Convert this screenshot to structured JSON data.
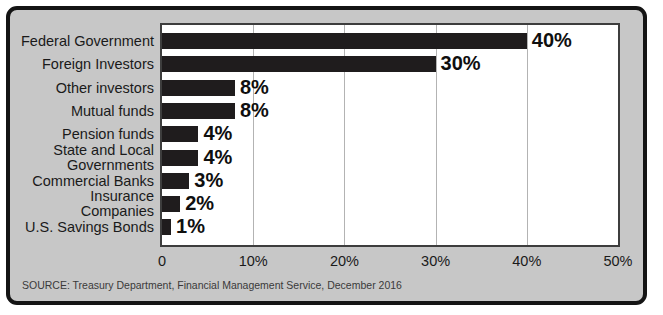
{
  "chart_data": {
    "type": "bar",
    "orientation": "horizontal",
    "title": "",
    "xlabel": "",
    "ylabel": "",
    "categories": [
      "Federal Government",
      "Foreign Investors",
      "Other investors",
      "Mutual funds",
      "Pension funds",
      "State and Local Governments",
      "Commercial Banks",
      "Insurance Companies",
      "U.S. Savings Bonds"
    ],
    "values": [
      40,
      30,
      8,
      8,
      4,
      4,
      3,
      2,
      1
    ],
    "value_labels": [
      "40%",
      "30%",
      "8%",
      "8%",
      "4%",
      "4%",
      "3%",
      "2%",
      "1%"
    ],
    "xlim": [
      0,
      50
    ],
    "x_ticks": [
      "0",
      "10%",
      "20%",
      "30%",
      "40%",
      "50%"
    ],
    "grid": true,
    "legend": "none",
    "bar_color": "#1f1c1d",
    "plot_background": "#ffffff",
    "panel_background": "#c7c7c7"
  },
  "source_note": "SOURCE: Treasury Department, Financial Management Service, December 2016"
}
